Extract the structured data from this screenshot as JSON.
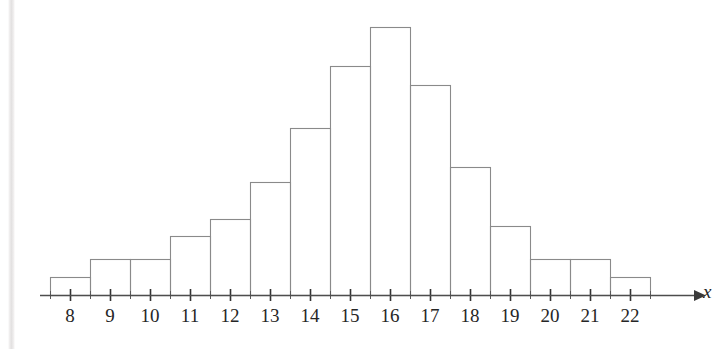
{
  "figure": {
    "background_color": "#ffffff",
    "line_color": "#8a8a8a",
    "text_color": "#262626",
    "axis_variable_label": "x"
  },
  "chart_data": {
    "type": "bar",
    "title": "",
    "subtitle": "",
    "xlabel": "x",
    "ylabel": "",
    "grid": false,
    "legend": null,
    "categories": [
      "8",
      "9",
      "10",
      "11",
      "12",
      "13",
      "14",
      "15",
      "16",
      "17",
      "18",
      "19",
      "20",
      "21",
      "22"
    ],
    "values": [
      18,
      36,
      36,
      59,
      76,
      113,
      167,
      229,
      268,
      210,
      128,
      69,
      36,
      36,
      18
    ],
    "value_units": "pixel-height (frequency, unlabeled axis)",
    "xlim": [
      7.5,
      22.5
    ],
    "ylim": [
      0,
      268
    ],
    "x_tick_labels": [
      "8",
      "9",
      "10",
      "11",
      "12",
      "13",
      "14",
      "15",
      "16",
      "17",
      "18",
      "19",
      "20",
      "21",
      "22"
    ],
    "y_tick_labels": [],
    "annotations": []
  },
  "axis": {
    "tick_labels": [
      {
        "label": "8",
        "center_x": 70
      },
      {
        "label": "9",
        "center_x": 110
      },
      {
        "label": "10",
        "center_x": 150
      },
      {
        "label": "11",
        "center_x": 190
      },
      {
        "label": "12",
        "center_x": 230
      },
      {
        "label": "13",
        "center_x": 270
      },
      {
        "label": "14",
        "center_x": 310
      },
      {
        "label": "15",
        "center_x": 350
      },
      {
        "label": "16",
        "center_x": 390
      },
      {
        "label": "17",
        "center_x": 430
      },
      {
        "label": "18",
        "center_x": 470
      },
      {
        "label": "19",
        "center_x": 510
      },
      {
        "label": "20",
        "center_x": 550
      },
      {
        "label": "21",
        "center_x": 590
      },
      {
        "label": "22",
        "center_x": 630
      }
    ]
  }
}
